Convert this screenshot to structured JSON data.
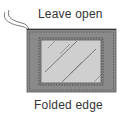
{
  "diagram": {
    "labels": {
      "top": "Leave open",
      "bottom": "Folded edge"
    },
    "colors": {
      "fabric": "#8a8a8a",
      "glass": "#cfcfcf",
      "stitch": "#444444",
      "text": "#333333"
    }
  }
}
